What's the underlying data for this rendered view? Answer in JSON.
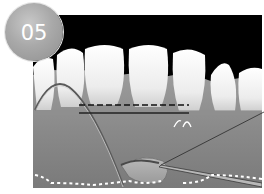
{
  "step_badge": {
    "label": "05",
    "color": "#a6a6a6",
    "text_color": "#ffffff"
  },
  "illustration": {
    "subject": "lower-anterior-teeth-gingiva-procedure",
    "annotations": {
      "dashed_line": "reference-line-dashed",
      "solid_line": "reference-line-solid",
      "dotted_line": "mucogingival-border-dotted"
    },
    "colors": {
      "background": "#000000",
      "tooth": "#f2f2f2",
      "gum": "#8a8a8a",
      "dotted": "#ffffff"
    }
  }
}
